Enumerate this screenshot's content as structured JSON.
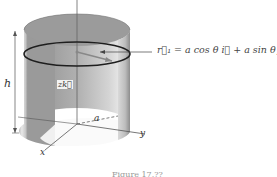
{
  "diagram": {
    "labels": {
      "equation": "r⃗₁ = a cos θ i⃗ + a sin θ j⃗",
      "height": "h",
      "radius": "a",
      "x_axis": "x",
      "y_axis": "y",
      "z_component": "zk⃗"
    },
    "caption": "Figure 17.??",
    "colors": {
      "surface_light": "#e6e6e6",
      "surface_dark": "#8a8a8a",
      "ring": "#222222",
      "axis": "#555555"
    }
  }
}
